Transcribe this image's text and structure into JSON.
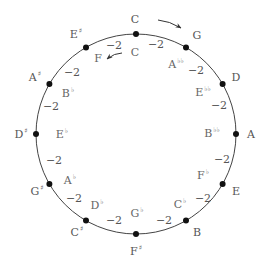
{
  "diagram": {
    "circle": {
      "cx": 136,
      "cy": 134,
      "r": 100,
      "stroke": "#444444"
    },
    "outer_notes": [
      {
        "name": "C",
        "acc": "",
        "x": 135,
        "y": 19
      },
      {
        "name": "G",
        "acc": "",
        "x": 197,
        "y": 35
      },
      {
        "name": "D",
        "acc": "",
        "x": 236,
        "y": 77
      },
      {
        "name": "A",
        "acc": "",
        "x": 251,
        "y": 134
      },
      {
        "name": "E",
        "acc": "",
        "x": 236,
        "y": 191
      },
      {
        "name": "B",
        "acc": "",
        "x": 197,
        "y": 232
      },
      {
        "name": "F",
        "acc": "♯",
        "x": 136,
        "y": 251
      },
      {
        "name": "C",
        "acc": "♯",
        "x": 77,
        "y": 232
      },
      {
        "name": "G",
        "acc": "♯",
        "x": 37,
        "y": 191
      },
      {
        "name": "D",
        "acc": "♯",
        "x": 21,
        "y": 134
      },
      {
        "name": "A",
        "acc": "♯",
        "x": 35,
        "y": 77
      },
      {
        "name": "E",
        "acc": "♯",
        "x": 76,
        "y": 34
      }
    ],
    "inner_notes": [
      {
        "name": "C",
        "acc": "",
        "x": 135,
        "y": 52
      },
      {
        "name": "A",
        "acc": "♭♭",
        "x": 176,
        "y": 64
      },
      {
        "name": "E",
        "acc": "♭♭",
        "x": 203,
        "y": 92
      },
      {
        "name": "B",
        "acc": "♭♭",
        "x": 212,
        "y": 133
      },
      {
        "name": "F",
        "acc": "♭",
        "x": 203,
        "y": 175
      },
      {
        "name": "C",
        "acc": "♭",
        "x": 180,
        "y": 204
      },
      {
        "name": "G",
        "acc": "♭",
        "x": 137,
        "y": 213
      },
      {
        "name": "D",
        "acc": "♭",
        "x": 97,
        "y": 205
      },
      {
        "name": "A",
        "acc": "♭",
        "x": 70,
        "y": 180
      },
      {
        "name": "E",
        "acc": "♭",
        "x": 62,
        "y": 134
      },
      {
        "name": "B",
        "acc": "♭",
        "x": 68,
        "y": 93
      },
      {
        "name": "F",
        "acc": "",
        "x": 98,
        "y": 58
      }
    ],
    "interval_label": "−2",
    "intervals": [
      {
        "x": 156,
        "y": 44
      },
      {
        "x": 196,
        "y": 70
      },
      {
        "x": 219,
        "y": 105
      },
      {
        "x": 222,
        "y": 159
      },
      {
        "x": 203,
        "y": 198
      },
      {
        "x": 164,
        "y": 220
      },
      {
        "x": 114,
        "y": 220
      },
      {
        "x": 74,
        "y": 198
      },
      {
        "x": 54,
        "y": 160
      },
      {
        "x": 51,
        "y": 106
      },
      {
        "x": 72,
        "y": 72
      },
      {
        "x": 114,
        "y": 45
      }
    ],
    "arrows": [
      {
        "name": "clockwise-arrow",
        "x1": 158,
        "y1": 20,
        "x2": 181,
        "y2": 28
      },
      {
        "name": "counterclockwise-arrow",
        "x1": 122,
        "y1": 53,
        "x2": 107,
        "y2": 59
      }
    ]
  }
}
